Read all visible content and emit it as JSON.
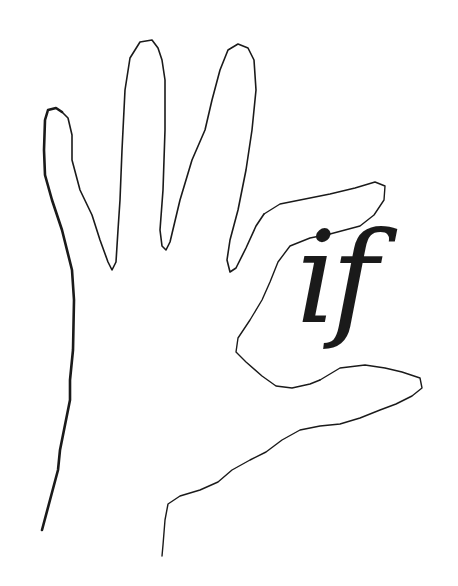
{
  "logo": {
    "text": "if",
    "description": "Hand outline line drawing holding the italic letters 'if'",
    "colors": {
      "ink": "#1a1a1a",
      "background": "#ffffff"
    },
    "icons": [
      "hand-outline-icon"
    ]
  }
}
